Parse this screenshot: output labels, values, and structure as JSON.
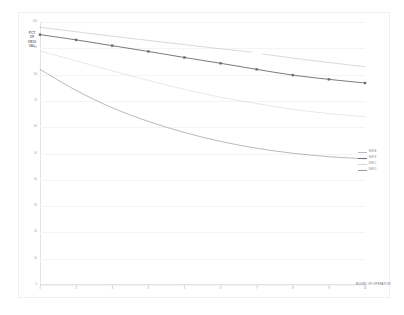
{
  "chart_data": {
    "type": "line",
    "title": "",
    "subtitle": "",
    "xlabel": "ROUND OF OPERATION",
    "ylabel": "PERCENT OF ORIGINAL VALUE",
    "ylabel_lines": [
      "PCT",
      "OF",
      "ORIG",
      "VAL"
    ],
    "xlim": [
      1,
      10
    ],
    "ylim": [
      0,
      100
    ],
    "grid": true,
    "grid_axis": "y",
    "legend_position": "right",
    "x": [
      1,
      2,
      3,
      4,
      5,
      6,
      7,
      8,
      9,
      10
    ],
    "xticklabels": [
      "1",
      "2",
      "3",
      "4",
      "5",
      "6",
      "7",
      "8",
      "9",
      "10"
    ],
    "yticks": [
      0,
      10,
      20,
      30,
      40,
      50,
      60,
      70,
      80,
      90,
      100
    ],
    "yticklabels": [
      "0",
      "10",
      "20",
      "30",
      "40",
      "50",
      "60",
      "70",
      "80",
      "90",
      "100"
    ],
    "series": [
      {
        "name": "A",
        "legend_label": "SER A",
        "color": "#b9b9c0",
        "width": 0.55,
        "marker": "none",
        "gap_after_x": 7,
        "values": [
          98.0,
          96.3,
          94.6,
          93.0,
          91.4,
          89.8,
          88.2,
          86.3,
          84.6,
          83.0
        ]
      },
      {
        "name": "B",
        "legend_label": "SER B",
        "color": "#6a6a72",
        "width": 0.9,
        "marker": "square",
        "values": [
          95.2,
          93.2,
          91.0,
          88.8,
          86.5,
          84.3,
          82.0,
          79.8,
          78.2,
          76.8
        ]
      },
      {
        "name": "C",
        "legend_label": "SER C",
        "color": "#d6d6dc",
        "width": 0.6,
        "marker": "none",
        "values": [
          89.0,
          85.2,
          81.4,
          77.8,
          74.4,
          71.4,
          69.0,
          66.8,
          65.2,
          64.0
        ]
      },
      {
        "name": "D",
        "legend_label": "SER D",
        "color": "#9a9aa2",
        "width": 0.7,
        "marker": "none",
        "values": [
          82.0,
          74.0,
          67.4,
          62.2,
          58.0,
          54.6,
          52.0,
          50.1,
          48.8,
          48.0
        ]
      }
    ]
  },
  "legend": {
    "items": [
      {
        "label": "SER A"
      },
      {
        "label": "SER B"
      },
      {
        "label": "SER C"
      },
      {
        "label": "SER D"
      }
    ]
  }
}
